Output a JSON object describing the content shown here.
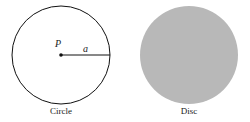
{
  "figures": [
    {
      "caption": "Circle",
      "center_label": "P",
      "radius_label": "a",
      "stroke_color": "#111111"
    },
    {
      "caption": "Disc",
      "fill_color": "#b5b5b5"
    }
  ]
}
